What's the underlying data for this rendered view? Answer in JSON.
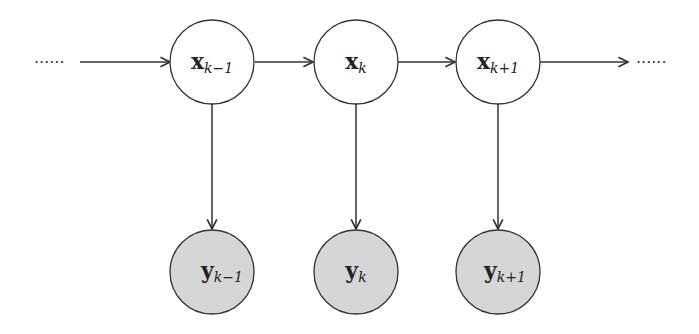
{
  "diagram": {
    "type": "hidden-markov-model",
    "colors": {
      "stroke": "#333333",
      "hidden_fill": "#ffffff",
      "observed_fill": "#d6d6d6"
    },
    "leading_ellipsis": "······",
    "trailing_ellipsis": "······",
    "hidden_nodes": [
      {
        "base": "x",
        "sub": "k−1"
      },
      {
        "base": "x",
        "sub": "k"
      },
      {
        "base": "x",
        "sub": "k+1"
      }
    ],
    "observed_nodes": [
      {
        "base": "y",
        "sub": "k−1"
      },
      {
        "base": "y",
        "sub": "k"
      },
      {
        "base": "y",
        "sub": "k+1"
      }
    ]
  }
}
